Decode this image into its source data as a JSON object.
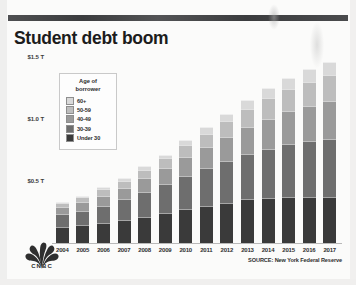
{
  "header": {
    "title": "Student debt boom"
  },
  "footer": {
    "source": "SOURCE: New York Federal Reserve",
    "brand": "CNBC"
  },
  "legend": {
    "title_line1": "Age of",
    "title_line2": "borrower"
  },
  "colors": {
    "background": "#fbfbfa",
    "topbar": "#3b3c3e",
    "title": "#1c1c1c",
    "axis": "#b9b9b9",
    "seg_60_plus": "#d9d9d9",
    "seg_50_59": "#bdbdbd",
    "seg_40_49": "#9a9a9a",
    "seg_30_39": "#6e6e6e",
    "seg_under_30": "#3a3a3a"
  },
  "chart_data": {
    "type": "bar",
    "title": "Student debt boom",
    "subtitle": "",
    "xlabel": "",
    "ylabel": "Total student debt outstanding (trillions)",
    "stacked": true,
    "grid": false,
    "legend_position": "inside-top-left",
    "legend_title": "Age of borrower",
    "ylim": [
      0,
      1.5
    ],
    "yticks": [
      0.5,
      1.0,
      1.5
    ],
    "ytick_labels": [
      "$0.5 T",
      "$1.0 T",
      "$1.5 T"
    ],
    "categories": [
      "2004",
      "2005",
      "2006",
      "2007",
      "2008",
      "2009",
      "2010",
      "2011",
      "2012",
      "2013",
      "2014",
      "2015",
      "2016",
      "2017"
    ],
    "series": [
      {
        "name": "Under 30",
        "color": "#3a3a3a",
        "values": [
          0.14,
          0.15,
          0.17,
          0.19,
          0.22,
          0.25,
          0.28,
          0.31,
          0.33,
          0.36,
          0.37,
          0.38,
          0.38,
          0.38
        ]
      },
      {
        "name": "30-39",
        "color": "#6e6e6e",
        "values": [
          0.1,
          0.12,
          0.14,
          0.17,
          0.2,
          0.23,
          0.27,
          0.3,
          0.34,
          0.37,
          0.4,
          0.43,
          0.45,
          0.47
        ]
      },
      {
        "name": "40-49",
        "color": "#9a9a9a",
        "values": [
          0.06,
          0.07,
          0.08,
          0.09,
          0.11,
          0.13,
          0.15,
          0.17,
          0.19,
          0.21,
          0.24,
          0.26,
          0.28,
          0.3
        ]
      },
      {
        "name": "50-59",
        "color": "#bdbdbd",
        "values": [
          0.03,
          0.04,
          0.05,
          0.06,
          0.07,
          0.08,
          0.1,
          0.11,
          0.13,
          0.15,
          0.17,
          0.18,
          0.2,
          0.21
        ]
      },
      {
        "name": "60+",
        "color": "#d9d9d9",
        "values": [
          0.01,
          0.01,
          0.02,
          0.02,
          0.03,
          0.03,
          0.04,
          0.05,
          0.06,
          0.07,
          0.08,
          0.09,
          0.1,
          0.11
        ]
      }
    ],
    "totals": [
      0.34,
      0.39,
      0.46,
      0.53,
      0.63,
      0.72,
      0.84,
      0.94,
      1.05,
      1.16,
      1.26,
      1.34,
      1.41,
      1.47
    ],
    "source": "SOURCE: New York Federal Reserve"
  }
}
